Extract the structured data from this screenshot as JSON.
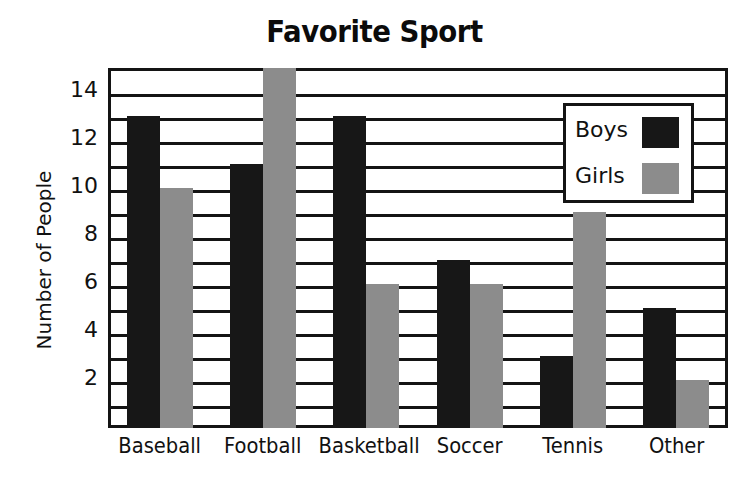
{
  "chart_data": {
    "type": "bar",
    "title": "Favorite Sport",
    "xlabel": "",
    "ylabel": "Number of People",
    "categories": [
      "Baseball",
      "Football",
      "Basketball",
      "Soccer",
      "Tennis",
      "Other"
    ],
    "series": [
      {
        "name": "Boys",
        "color": "#171717",
        "values": [
          13,
          11,
          13,
          7,
          3,
          5
        ]
      },
      {
        "name": "Girls",
        "color": "#8c8c8c",
        "values": [
          10,
          15,
          6,
          6,
          9,
          2
        ]
      }
    ],
    "ylim": [
      0,
      15
    ],
    "ytick_labels": [
      "2",
      "4",
      "6",
      "8",
      "10",
      "12",
      "14"
    ],
    "ytick_values": [
      2,
      4,
      6,
      8,
      10,
      12,
      14
    ],
    "grid": true,
    "grid_step": 1,
    "legend_position": "upper-right",
    "background": "#ffffff",
    "axis_color": "#141414"
  }
}
